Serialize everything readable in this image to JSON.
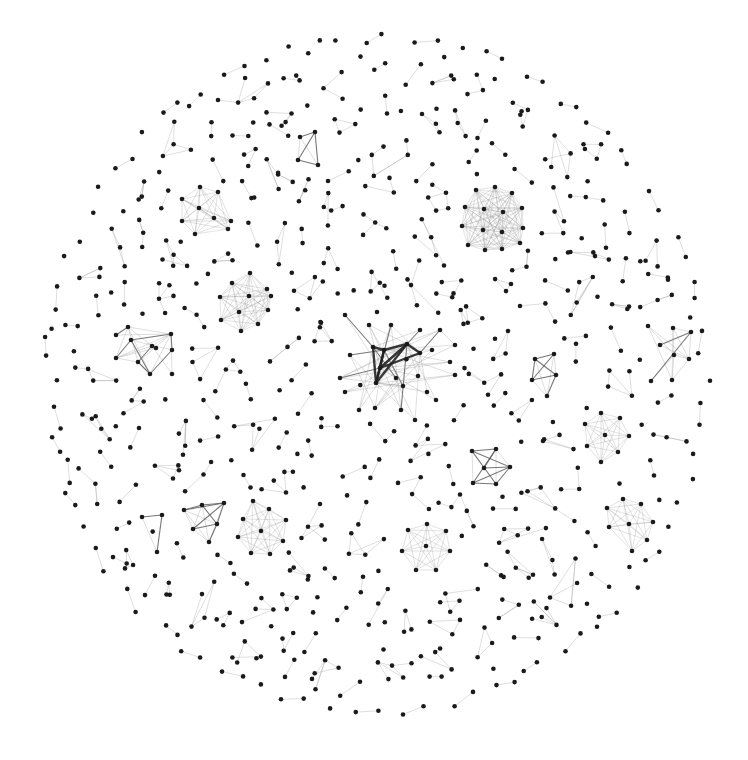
{
  "figure": {
    "type": "network-graph",
    "layout": "force-directed",
    "width": 748,
    "height": 760,
    "background": "#ffffff",
    "node_color": "#1a1a1a",
    "edge_color": "#9a9a9a",
    "heavy_edge_color": "#222222",
    "node_radius": 2.3,
    "boundary": {
      "cx": 377,
      "cy": 375,
      "rx": 338,
      "ry": 348
    }
  },
  "hubs": [
    {
      "id": "central-hub",
      "description": "central hub with heavy edges",
      "center": [
        390,
        365
      ],
      "nodes": [
        [
          384,
          350
        ],
        [
          380,
          368
        ],
        [
          376,
          383
        ],
        [
          407,
          344
        ],
        [
          420,
          353
        ],
        [
          373,
          347
        ],
        [
          350,
          355
        ],
        [
          340,
          378
        ],
        [
          345,
          392
        ],
        [
          359,
          410
        ],
        [
          375,
          408
        ],
        [
          396,
          378
        ],
        [
          403,
          386
        ],
        [
          418,
          376
        ],
        [
          427,
          392
        ],
        [
          401,
          410
        ],
        [
          432,
          350
        ],
        [
          450,
          362
        ],
        [
          455,
          375
        ],
        [
          369,
          325
        ],
        [
          391,
          325
        ],
        [
          420,
          330
        ],
        [
          440,
          330
        ],
        [
          345,
          315
        ],
        [
          455,
          345
        ],
        [
          436,
          400
        ],
        [
          415,
          420
        ]
      ],
      "heavy_edges": [
        [
          0,
          1
        ],
        [
          1,
          2
        ],
        [
          0,
          2
        ],
        [
          0,
          3
        ],
        [
          1,
          3
        ],
        [
          2,
          3
        ],
        [
          3,
          4
        ],
        [
          1,
          4
        ],
        [
          0,
          5
        ],
        [
          2,
          5
        ]
      ],
      "style": "hub"
    },
    {
      "id": "dense-cluster-top-right",
      "center": [
        490,
        218
      ],
      "nodes": [
        [
          476,
          190
        ],
        [
          495,
          187
        ],
        [
          512,
          193
        ],
        [
          465,
          207
        ],
        [
          484,
          209
        ],
        [
          503,
          212
        ],
        [
          522,
          208
        ],
        [
          462,
          226
        ],
        [
          483,
          230
        ],
        [
          502,
          232
        ],
        [
          523,
          228
        ],
        [
          468,
          245
        ],
        [
          485,
          250
        ],
        [
          502,
          249
        ],
        [
          520,
          243
        ]
      ],
      "style": "clique"
    },
    {
      "id": "cluster-upper-left",
      "center": [
        207,
        210
      ],
      "nodes": [
        [
          200,
          187
        ],
        [
          218,
          192
        ],
        [
          182,
          199
        ],
        [
          199,
          208
        ],
        [
          214,
          218
        ],
        [
          182,
          221
        ],
        [
          195,
          234
        ],
        [
          231,
          221
        ],
        [
          228,
          229
        ]
      ],
      "style": "clique"
    },
    {
      "id": "cluster-left-mid",
      "center": [
        240,
        300
      ],
      "nodes": [
        [
          250,
          273
        ],
        [
          232,
          283
        ],
        [
          220,
          297
        ],
        [
          249,
          296
        ],
        [
          267,
          289
        ],
        [
          239,
          312
        ],
        [
          268,
          310
        ],
        [
          221,
          320
        ],
        [
          258,
          324
        ],
        [
          241,
          331
        ],
        [
          271,
          296
        ]
      ],
      "style": "clique"
    },
    {
      "id": "cluster-right-heptagon",
      "center": [
        606,
        434
      ],
      "nodes": [
        [
          601,
          413
        ],
        [
          585,
          424
        ],
        [
          620,
          418
        ],
        [
          605,
          435
        ],
        [
          629,
          436
        ],
        [
          587,
          446
        ],
        [
          618,
          452
        ],
        [
          601,
          462
        ]
      ],
      "style": "clique"
    },
    {
      "id": "cluster-bottom-left",
      "center": [
        262,
        528
      ],
      "nodes": [
        [
          253,
          501
        ],
        [
          243,
          519
        ],
        [
          269,
          509
        ],
        [
          286,
          520
        ],
        [
          238,
          537
        ],
        [
          261,
          531
        ],
        [
          283,
          541
        ],
        [
          251,
          553
        ],
        [
          270,
          554
        ]
      ],
      "style": "clique"
    },
    {
      "id": "cluster-bottom-center",
      "center": [
        427,
        547
      ],
      "nodes": [
        [
          427,
          524
        ],
        [
          408,
          530
        ],
        [
          446,
          531
        ],
        [
          402,
          551
        ],
        [
          426,
          546
        ],
        [
          450,
          551
        ],
        [
          416,
          570
        ],
        [
          436,
          570
        ]
      ],
      "style": "clique"
    },
    {
      "id": "cluster-bottom-right",
      "center": [
        627,
        518
      ],
      "nodes": [
        [
          623,
          499
        ],
        [
          607,
          508
        ],
        [
          641,
          504
        ],
        [
          629,
          524
        ],
        [
          653,
          522
        ],
        [
          609,
          527
        ],
        [
          647,
          540
        ],
        [
          632,
          551
        ]
      ],
      "style": "clique"
    },
    {
      "id": "triangle-bottom-left",
      "center": [
        155,
        530
      ],
      "nodes": [
        [
          142,
          517
        ],
        [
          162,
          515
        ],
        [
          157,
          552
        ]
      ],
      "style": "strong"
    },
    {
      "id": "kite-bottom-left",
      "center": [
        205,
        515
      ],
      "nodes": [
        [
          184,
          510
        ],
        [
          202,
          505
        ],
        [
          224,
          503
        ],
        [
          193,
          529
        ],
        [
          217,
          524
        ],
        [
          209,
          542
        ]
      ],
      "style": "strong"
    },
    {
      "id": "kite-right",
      "center": [
        543,
        375
      ],
      "nodes": [
        [
          535,
          359
        ],
        [
          554,
          354
        ],
        [
          532,
          380
        ],
        [
          556,
          375
        ],
        [
          547,
          396
        ]
      ],
      "style": "strong"
    },
    {
      "id": "star-right-mid",
      "center": [
        489,
        467
      ],
      "nodes": [
        [
          472,
          451
        ],
        [
          496,
          449
        ],
        [
          484,
          468
        ],
        [
          510,
          467
        ],
        [
          473,
          483
        ],
        [
          496,
          484
        ]
      ],
      "style": "strong"
    },
    {
      "id": "cluster-left",
      "center": [
        150,
        350
      ],
      "nodes": [
        [
          131,
          340
        ],
        [
          152,
          346
        ],
        [
          138,
          362
        ],
        [
          156,
          348
        ],
        [
          172,
          350
        ],
        [
          116,
          358
        ],
        [
          116,
          335
        ],
        [
          128,
          327
        ],
        [
          171,
          334
        ],
        [
          150,
          374
        ],
        [
          172,
          374
        ]
      ],
      "style": "mixed"
    },
    {
      "id": "cluster-far-right",
      "center": [
        670,
        350
      ],
      "nodes": [
        [
          660,
          345
        ],
        [
          674,
          355
        ],
        [
          648,
          326
        ],
        [
          673,
          328
        ],
        [
          689,
          359
        ],
        [
          651,
          381
        ],
        [
          672,
          380
        ],
        [
          691,
          332
        ]
      ],
      "style": "mixed"
    },
    {
      "id": "square-upper-mid",
      "center": [
        310,
        150
      ],
      "nodes": [
        [
          300,
          137
        ],
        [
          315,
          132
        ],
        [
          298,
          160
        ],
        [
          318,
          165
        ]
      ],
      "style": "strong"
    }
  ],
  "small_components": {
    "count": 240,
    "description": "many small trees, pairs and triangles scattered inside a circular layout",
    "seed": 1337
  },
  "isolated_ring": {
    "description": "outer ring of sparse pairs/chains along the circle edge",
    "count": 85
  }
}
